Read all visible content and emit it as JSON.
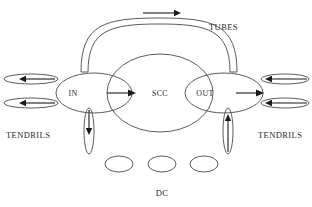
{
  "figure": {
    "background_color": "#ffffff",
    "stroke_color": "#4a4a4a",
    "arrow_color": "#1a1a1a",
    "text_color": "#2b2b2b"
  },
  "nodes": {
    "in": {
      "label": "IN",
      "cx": 94,
      "cy": 93,
      "rx": 38,
      "ry": 20
    },
    "scc": {
      "label": "SCC",
      "cx": 160,
      "cy": 93,
      "rx": 53,
      "ry": 39
    },
    "out": {
      "label": "OUT",
      "cx": 224,
      "cy": 93,
      "rx": 39,
      "ry": 20
    }
  },
  "regions": {
    "tubes": {
      "label": "TUBES"
    },
    "tendrils_left": {
      "label": "TENDRILS"
    },
    "tendrils_right": {
      "label": "TENDRILS"
    },
    "dc": {
      "label": "DC"
    }
  },
  "tendrils": {
    "left_upper": {
      "cx": 31,
      "cy": 79,
      "rx": 27,
      "ry": 5,
      "arrow_direction": "left"
    },
    "left_lower": {
      "cx": 31,
      "cy": 103,
      "rx": 27,
      "ry": 5,
      "arrow_direction": "left"
    },
    "right_upper": {
      "cx": 285,
      "cy": 79,
      "rx": 24,
      "ry": 5,
      "arrow_direction": "left"
    },
    "right_lower": {
      "cx": 285,
      "cy": 103,
      "rx": 24,
      "ry": 5,
      "arrow_direction": "left"
    },
    "bottom_left": {
      "cx": 89,
      "cy": 131,
      "rx": 5,
      "ry": 23,
      "arrow_direction": "down"
    },
    "bottom_right": {
      "cx": 228,
      "cy": 131,
      "rx": 5,
      "ry": 23,
      "arrow_direction": "up"
    }
  },
  "dc_components": [
    {
      "cx": 119,
      "cy": 164,
      "rx": 14,
      "ry": 8
    },
    {
      "cx": 162,
      "cy": 164,
      "rx": 14,
      "ry": 8
    },
    {
      "cx": 204,
      "cy": 164,
      "rx": 14,
      "ry": 8
    }
  ],
  "flow_arrows": {
    "tube_top": {
      "x1": 143,
      "y1": 13,
      "x2": 177,
      "y2": 13,
      "direction": "right"
    },
    "in_to_scc": {
      "x1": 107,
      "y1": 93,
      "x2": 133,
      "y2": 93,
      "direction": "right"
    },
    "out_outward": {
      "x1": 236,
      "y1": 93,
      "x2": 262,
      "y2": 93,
      "direction": "right"
    }
  },
  "labels": {
    "tubes_pos": {
      "x": 209,
      "y": 30
    },
    "tendrils_left_pos": {
      "x": 6,
      "y": 138
    },
    "tendrils_right_pos": {
      "x": 258,
      "y": 138
    },
    "dc_pos": {
      "x": 155,
      "y": 196
    }
  }
}
